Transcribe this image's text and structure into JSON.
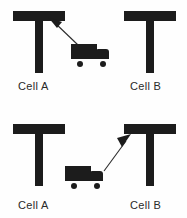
{
  "figure": {
    "type": "diagram",
    "background_color": "#fefefe",
    "ink_color": "#1c1c1c",
    "text_color": "#2a2a2a"
  },
  "panels": [
    {
      "id": "top",
      "description": "Truck travelling toward Cell A",
      "machines": [
        {
          "id": "top-cell-a",
          "label": "Cell A",
          "shape": "T"
        },
        {
          "id": "top-cell-b",
          "label": "Cell B",
          "shape": "T"
        }
      ],
      "vehicle": {
        "name": "truck",
        "wheels": 2
      },
      "arrow": {
        "direction": "up-left",
        "from": "truck",
        "to": "Cell A"
      }
    },
    {
      "id": "bottom",
      "description": "Truck travelling toward Cell B",
      "machines": [
        {
          "id": "bottom-cell-a",
          "label": "Cell A",
          "shape": "T"
        },
        {
          "id": "bottom-cell-b",
          "label": "Cell B",
          "shape": "T"
        }
      ],
      "vehicle": {
        "name": "truck",
        "wheels": 2
      },
      "arrow": {
        "direction": "up-right",
        "from": "truck",
        "to": "Cell B"
      }
    }
  ],
  "labels": {
    "top_left": "Cell A",
    "top_right": "Cell B",
    "bottom_left": "Cell A",
    "bottom_right": "Cell B"
  }
}
